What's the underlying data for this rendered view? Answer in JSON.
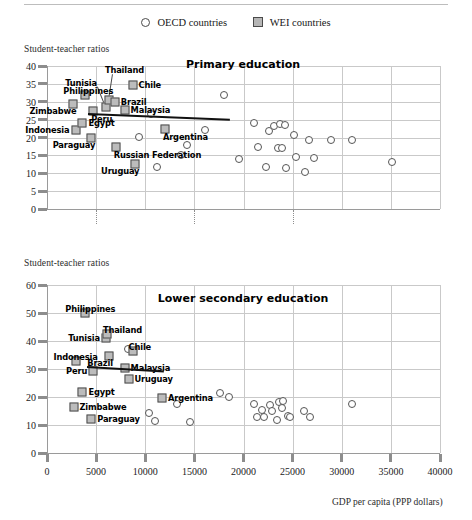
{
  "legend": {
    "items": [
      {
        "label": "OECD countries",
        "marker": "circle-marker-icon"
      },
      {
        "label": "WEI countries",
        "marker": "square-marker-icon"
      }
    ]
  },
  "axis_caption_top": "Student-teacher ratios",
  "axis_caption_bottom": "Student-teacher ratios",
  "xaxis_title": "GDP per capita (PPP dollars)",
  "chart_data": [
    {
      "type": "scatter",
      "title": "Primary education",
      "xlabel": "GDP per capita (PPP dollars)",
      "ylabel": "Student-teacher ratios",
      "xlim": [
        0,
        40000
      ],
      "ylim": [
        0,
        40
      ],
      "xticks": [
        0,
        5000,
        10000,
        15000,
        20000,
        25000,
        30000,
        35000,
        40000
      ],
      "yticks": [
        0,
        5,
        10,
        15,
        20,
        25,
        30,
        35,
        40
      ],
      "grid": "horizontal-and-vertical",
      "legend_position": "top-center",
      "trendline": {
        "x0": 4200,
        "y0": 26.9,
        "x1": 18600,
        "y1": 25.3
      },
      "series": [
        {
          "name": "WEI countries",
          "marker": "square",
          "points": [
            {
              "label": "Philippines",
              "x": 3900,
              "y": 31.8,
              "label_pos": "above-left"
            },
            {
              "label": "Zimbabwe",
              "x": 2600,
              "y": 29.3,
              "label_pos": "below-left"
            },
            {
              "label": "Indonesia",
              "x": 2900,
              "y": 22.0,
              "label_pos": "left"
            },
            {
              "label": "Egypt",
              "x": 3600,
              "y": 24.2,
              "label_pos": "right"
            },
            {
              "label": "Paraguay",
              "x": 4500,
              "y": 19.8,
              "label_pos": "below-left"
            },
            {
              "label": "Tunisia",
              "x": 6000,
              "y": 28.5,
              "label_pos": "leader-up-left"
            },
            {
              "label": "Thailand",
              "x": 6300,
              "y": 30.6,
              "label_pos": "leader-up"
            },
            {
              "label": "Brazil",
              "x": 6900,
              "y": 30.0,
              "label_pos": "right"
            },
            {
              "label": "Peru",
              "x": 4700,
              "y": 27.4,
              "label_pos": "below-right"
            },
            {
              "label": "Malaysia",
              "x": 7900,
              "y": 27.6,
              "label_pos": "right"
            },
            {
              "label": "Chile",
              "x": 8700,
              "y": 34.8,
              "label_pos": "right"
            },
            {
              "label": "Russian Federation",
              "x": 7000,
              "y": 17.3,
              "label_pos": "below-right"
            },
            {
              "label": "Uruguay",
              "x": 9000,
              "y": 12.6,
              "label_pos": "below-left"
            },
            {
              "label": "Argentina",
              "x": 12000,
              "y": 22.3,
              "label_pos": "below-right"
            }
          ]
        },
        {
          "name": "OECD countries",
          "marker": "circle",
          "points": [
            {
              "x": 10600,
              "y": 26.6
            },
            {
              "x": 9400,
              "y": 20.1
            },
            {
              "x": 11200,
              "y": 11.8
            },
            {
              "x": 13600,
              "y": 15.1
            },
            {
              "x": 14200,
              "y": 18.0
            },
            {
              "x": 16100,
              "y": 22.0
            },
            {
              "x": 18000,
              "y": 32.0
            },
            {
              "x": 19500,
              "y": 14.0
            },
            {
              "x": 21100,
              "y": 24.0
            },
            {
              "x": 21500,
              "y": 17.3
            },
            {
              "x": 22300,
              "y": 11.8
            },
            {
              "x": 22600,
              "y": 21.8
            },
            {
              "x": 23100,
              "y": 23.2
            },
            {
              "x": 23500,
              "y": 17.2
            },
            {
              "x": 23700,
              "y": 23.8
            },
            {
              "x": 23900,
              "y": 17.1
            },
            {
              "x": 24200,
              "y": 23.6
            },
            {
              "x": 24300,
              "y": 11.6
            },
            {
              "x": 25100,
              "y": 20.6
            },
            {
              "x": 25300,
              "y": 14.6
            },
            {
              "x": 26300,
              "y": 10.5
            },
            {
              "x": 26700,
              "y": 19.4
            },
            {
              "x": 27200,
              "y": 14.3
            },
            {
              "x": 28900,
              "y": 19.3
            },
            {
              "x": 31000,
              "y": 19.3
            },
            {
              "x": 35100,
              "y": 13.2
            }
          ]
        }
      ]
    },
    {
      "type": "scatter",
      "title": "Lower secondary education",
      "xlabel": "GDP per capita (PPP dollars)",
      "ylabel": "Student-teacher ratios",
      "xlim": [
        0,
        40000
      ],
      "ylim": [
        0,
        60
      ],
      "xticks": [
        0,
        5000,
        10000,
        15000,
        20000,
        25000,
        30000,
        35000,
        40000
      ],
      "yticks": [
        0,
        10,
        20,
        30,
        40,
        50,
        60
      ],
      "grid": "horizontal-and-vertical",
      "legend_position": "top-center",
      "trendline": {
        "x0": 4100,
        "y0": 31.0,
        "x1": 11900,
        "y1": 29.4
      },
      "series": [
        {
          "name": "WEI countries",
          "marker": "square",
          "points": [
            {
              "label": "Philippines",
              "x": 3900,
              "y": 50.0,
              "label_pos": "above"
            },
            {
              "label": "Tunisia",
              "x": 6000,
              "y": 41.0,
              "label_pos": "left"
            },
            {
              "label": "Thailand",
              "x": 6100,
              "y": 42.5,
              "label_pos": "above-right"
            },
            {
              "label": "Indonesia",
              "x": 2900,
              "y": 32.8,
              "label_pos": "above-left"
            },
            {
              "label": "Brazil",
              "x": 6300,
              "y": 34.8,
              "label_pos": "below-left"
            },
            {
              "label": "Chile",
              "x": 8700,
              "y": 36.4,
              "label_pos": "above-right"
            },
            {
              "label": "Malaysia",
              "x": 7900,
              "y": 30.2,
              "label_pos": "right"
            },
            {
              "label": "Peru",
              "x": 4700,
              "y": 29.2,
              "label_pos": "left"
            },
            {
              "label": "Uruguay",
              "x": 8300,
              "y": 26.4,
              "label_pos": "right"
            },
            {
              "label": "Egypt",
              "x": 3600,
              "y": 21.8,
              "label_pos": "right"
            },
            {
              "label": "Zimbabwe",
              "x": 2700,
              "y": 16.6,
              "label_pos": "right"
            },
            {
              "label": "Paraguay",
              "x": 4500,
              "y": 12.0,
              "label_pos": "right"
            },
            {
              "label": "Argentina",
              "x": 11700,
              "y": 19.6,
              "label_pos": "right"
            }
          ]
        },
        {
          "name": "OECD countries",
          "marker": "circle",
          "points": [
            {
              "x": 8200,
              "y": 37.0
            },
            {
              "x": 10400,
              "y": 14.4
            },
            {
              "x": 11000,
              "y": 11.6
            },
            {
              "x": 13200,
              "y": 17.4
            },
            {
              "x": 14500,
              "y": 11.0
            },
            {
              "x": 17600,
              "y": 21.6
            },
            {
              "x": 18500,
              "y": 20.0
            },
            {
              "x": 21100,
              "y": 17.4
            },
            {
              "x": 21400,
              "y": 13.0
            },
            {
              "x": 21900,
              "y": 15.2
            },
            {
              "x": 22100,
              "y": 12.8
            },
            {
              "x": 22700,
              "y": 17.0
            },
            {
              "x": 22900,
              "y": 15.0
            },
            {
              "x": 23400,
              "y": 11.8
            },
            {
              "x": 23600,
              "y": 18.2
            },
            {
              "x": 23900,
              "y": 16.2
            },
            {
              "x": 24000,
              "y": 18.6
            },
            {
              "x": 24500,
              "y": 13.2
            },
            {
              "x": 24700,
              "y": 12.8
            },
            {
              "x": 26200,
              "y": 15.0
            },
            {
              "x": 26800,
              "y": 12.8
            },
            {
              "x": 31000,
              "y": 17.6
            }
          ]
        }
      ]
    }
  ]
}
